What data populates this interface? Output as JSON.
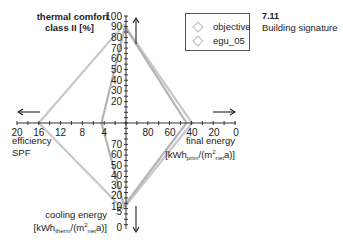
{
  "caption": {
    "number": "7.11",
    "title": "Building signature"
  },
  "legend": [
    {
      "label": "objective",
      "color": "#c8c8c8"
    },
    {
      "label": "egu_05",
      "color": "#b4b4b4"
    }
  ],
  "axes": {
    "top": {
      "label_line1": "thermal comfort",
      "label_line2": "class II [%]",
      "ticks": [
        "100",
        "90",
        "80",
        "70",
        "60",
        "50",
        "40",
        "30",
        "20"
      ]
    },
    "bottom": {
      "label_line1": "cooling energy",
      "label_line2": "[kWh",
      "label_sub1": "therm",
      "label_line2b": "/(m",
      "label_sup": "2",
      "label_sub2": "net",
      "label_end": "a)]",
      "ticks": [
        "70",
        "60",
        "50",
        "40",
        "30",
        "20",
        "10",
        "5",
        "0"
      ]
    },
    "left": {
      "label_line1": "efficiency",
      "label_line2": "SPF",
      "ticks": [
        "20",
        "16",
        "12",
        "8",
        "4"
      ]
    },
    "right": {
      "label_line1": "final energy",
      "label_line2": "[kWh",
      "label_sub1": "prim",
      "label_line2b": "/(m",
      "label_sup": "2",
      "label_sub2": "net",
      "label_end": "a)]",
      "ticks": [
        "80",
        "60",
        "40",
        "20",
        "0"
      ]
    }
  },
  "chart_data": {
    "type": "radar",
    "title": "Building signature",
    "figure_number": "7.11",
    "axes": [
      {
        "name": "thermal comfort class II [%]",
        "direction": "up",
        "range": [
          0,
          100
        ],
        "ticks": [
          20,
          30,
          40,
          50,
          60,
          70,
          80,
          90,
          100
        ]
      },
      {
        "name": "final energy [kWh_prim/(m²_net a)]",
        "direction": "right",
        "range": [
          100,
          0
        ],
        "ticks": [
          80,
          60,
          40,
          20,
          0
        ]
      },
      {
        "name": "cooling energy [kWh_therm/(m²_net a)]",
        "direction": "down",
        "range": [
          0,
          100
        ],
        "ticks": [
          70,
          60,
          50,
          40,
          30,
          20,
          10,
          5,
          0
        ]
      },
      {
        "name": "efficiency SPF",
        "direction": "left",
        "range": [
          0,
          20
        ],
        "ticks": [
          20,
          16,
          12,
          8,
          4
        ]
      }
    ],
    "series": [
      {
        "name": "objective",
        "values": {
          "thermal_comfort": 92,
          "final_energy": 40,
          "cooling_energy": 7,
          "efficiency_spf": 16
        }
      },
      {
        "name": "egu_05",
        "values": {
          "thermal_comfort": 90,
          "final_energy": 45,
          "cooling_energy": 10,
          "efficiency_spf": 4.5
        }
      }
    ],
    "legend_position": "top-right",
    "grid": false
  }
}
